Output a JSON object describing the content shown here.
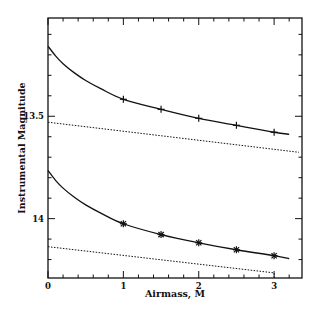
{
  "chart_data": {
    "type": "line",
    "title": "",
    "xlabel": "Airmass, M",
    "ylabel": "Instrumental Magnitude",
    "xlim": [
      0,
      3.37
    ],
    "ylim": [
      14.29,
      13.02
    ],
    "y_inverted": true,
    "grid": false,
    "legend": null,
    "x_ticks": [
      0,
      1,
      2,
      3
    ],
    "x_tick_labels": [
      "0",
      "1",
      "2",
      "3"
    ],
    "x_minor_step": 0.2,
    "y_ticks": [
      13.5,
      14
    ],
    "y_tick_labels": [
      "13.5",
      "14"
    ],
    "y_minor_step": 0.1,
    "series": [
      {
        "name": "upper-fit-curve",
        "style": "solid",
        "x": [
          0,
          0.1,
          0.2,
          0.35,
          0.5,
          0.7,
          1.0,
          1.5,
          2.0,
          2.5,
          3.0,
          3.2
        ],
        "y": [
          13.157,
          13.205,
          13.243,
          13.288,
          13.325,
          13.365,
          13.417,
          13.466,
          13.51,
          13.544,
          13.578,
          13.588
        ]
      },
      {
        "name": "upper-observations",
        "style": "markers",
        "marker": "plus",
        "x": [
          1.0,
          1.5,
          2.0,
          2.5,
          3.0
        ],
        "y": [
          13.417,
          13.466,
          13.51,
          13.544,
          13.578
        ]
      },
      {
        "name": "upper-linear-extinction",
        "style": "dotted",
        "x": [
          0,
          3.33
        ],
        "y": [
          13.529,
          13.676
        ]
      },
      {
        "name": "lower-fit-curve",
        "style": "solid",
        "x": [
          0,
          0.1,
          0.2,
          0.35,
          0.5,
          0.7,
          1.0,
          1.5,
          2.0,
          2.5,
          3.0,
          3.2
        ],
        "y": [
          13.765,
          13.813,
          13.851,
          13.896,
          13.933,
          13.973,
          14.025,
          14.078,
          14.118,
          14.152,
          14.181,
          14.196
        ]
      },
      {
        "name": "lower-observations",
        "style": "markers",
        "marker": "asterisk",
        "x": [
          1.0,
          1.5,
          2.0,
          2.5,
          3.0
        ],
        "y": [
          14.025,
          14.078,
          14.118,
          14.152,
          14.181
        ]
      },
      {
        "name": "lower-linear-extinction",
        "style": "dotted",
        "x": [
          0,
          3.0,
          3.0
        ],
        "y": [
          14.137,
          14.265,
          14.29
        ]
      }
    ]
  },
  "plot_frame": {
    "left": 48,
    "top": 18,
    "right": 302,
    "bottom": 278
  },
  "colors": {
    "ink": "#111111",
    "background": "#ffffff"
  }
}
